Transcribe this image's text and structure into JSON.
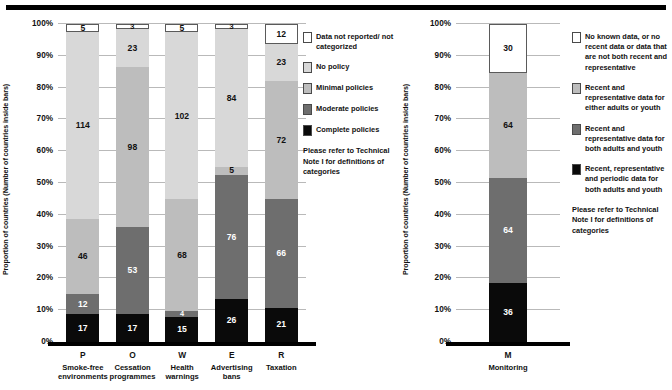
{
  "colors": {
    "not_reported": "#ffffff",
    "no_policy": "#d8d8d8",
    "minimal": "#bdbdbd",
    "moderate": "#6e6e6e",
    "complete": "#0a0a0a",
    "grid": "#b9b9b9",
    "axis": "#000000"
  },
  "left": {
    "y_axis_title": "Proportion of countries (Number of countries inside bars)",
    "y_ticks": [
      "0%",
      "10%",
      "20%",
      "30%",
      "40%",
      "50%",
      "60%",
      "70%",
      "80%",
      "90%",
      "100%"
    ],
    "legend": {
      "items": [
        {
          "label": "Data not reported/ not categorized",
          "swatch": "not_reported"
        },
        {
          "label": "No policy",
          "swatch": "no_policy"
        },
        {
          "label": "Minimal policies",
          "swatch": "minimal"
        },
        {
          "label": "Moderate policies",
          "swatch": "moderate"
        },
        {
          "label": "Complete policies",
          "swatch": "complete"
        }
      ],
      "note": "Please refer to Technical Note I for definitions of categories"
    },
    "categories": [
      {
        "code": "P",
        "name": "Smoke-free environments"
      },
      {
        "code": "O",
        "name": "Cessation programmes"
      },
      {
        "code": "W",
        "name": "Health warnings"
      },
      {
        "code": "E",
        "name": "Advertising bans"
      },
      {
        "code": "R",
        "name": "Taxation"
      }
    ]
  },
  "right": {
    "y_axis_title": "Proportion of countries (Number of countries inside bars)",
    "y_ticks": [
      "0%",
      "10%",
      "20%",
      "30%",
      "40%",
      "50%",
      "60%",
      "70%",
      "80%",
      "90%",
      "100%"
    ],
    "legend": {
      "items": [
        {
          "label": "No known data, or no recent data or data that are not both recent and representative",
          "swatch": "not_reported"
        },
        {
          "label": "Recent and representative data for either adults or youth",
          "swatch": "minimal"
        },
        {
          "label": "Recent and representative data for both adults and youth",
          "swatch": "moderate"
        },
        {
          "label": "Recent, representative and periodic data for both adults and youth",
          "swatch": "complete"
        }
      ],
      "note": "Please refer to Technical Note I for definitions of categories"
    },
    "categories": [
      {
        "code": "M",
        "name": "Monitoring"
      }
    ]
  },
  "chart_data": [
    {
      "type": "bar",
      "id": "mpower-policies",
      "stacked": true,
      "normalized": true,
      "title": "",
      "xlabel": "",
      "ylabel": "Proportion of countries (Number of countries inside bars)",
      "ylim": [
        0,
        100
      ],
      "ytick_labels": [
        "0%",
        "10%",
        "20%",
        "30%",
        "40%",
        "50%",
        "60%",
        "70%",
        "80%",
        "90%",
        "100%"
      ],
      "grid": true,
      "legend_position": "right",
      "total_countries": 194,
      "categories": [
        "P Smoke-free environments",
        "O Cessation programmes",
        "W Health warnings",
        "E Advertising bans",
        "R Taxation"
      ],
      "category_codes": [
        "P",
        "O",
        "W",
        "E",
        "R"
      ],
      "series": [
        {
          "name": "Complete policies",
          "color": "#0a0a0a",
          "values": [
            17,
            17,
            15,
            26,
            21
          ]
        },
        {
          "name": "Moderate policies",
          "color": "#6e6e6e",
          "values": [
            12,
            53,
            4,
            76,
            66
          ]
        },
        {
          "name": "Minimal policies",
          "color": "#bdbdbd",
          "values": [
            46,
            98,
            68,
            5,
            72
          ]
        },
        {
          "name": "No policy",
          "color": "#d8d8d8",
          "values": [
            114,
            23,
            102,
            84,
            23
          ]
        },
        {
          "name": "Data not reported/ not categorized",
          "color": "#ffffff",
          "values": [
            5,
            3,
            5,
            3,
            12
          ]
        }
      ]
    },
    {
      "type": "bar",
      "id": "mpower-monitoring",
      "stacked": true,
      "normalized": true,
      "title": "",
      "xlabel": "",
      "ylabel": "Proportion of countries (Number of countries inside bars)",
      "ylim": [
        0,
        100
      ],
      "ytick_labels": [
        "0%",
        "10%",
        "20%",
        "30%",
        "40%",
        "50%",
        "60%",
        "70%",
        "80%",
        "90%",
        "100%"
      ],
      "grid": true,
      "legend_position": "right",
      "total_countries": 194,
      "categories": [
        "M Monitoring"
      ],
      "category_codes": [
        "M"
      ],
      "series": [
        {
          "name": "Recent, representative and periodic data for both adults and youth",
          "color": "#0a0a0a",
          "values": [
            36
          ]
        },
        {
          "name": "Recent and representative data for both adults and youth",
          "color": "#6e6e6e",
          "values": [
            64
          ]
        },
        {
          "name": "Recent and representative data for either adults or youth",
          "color": "#bdbdbd",
          "values": [
            64
          ]
        },
        {
          "name": "No known data, or no recent data or data that are not both recent and representative",
          "color": "#ffffff",
          "values": [
            30
          ]
        }
      ]
    }
  ]
}
